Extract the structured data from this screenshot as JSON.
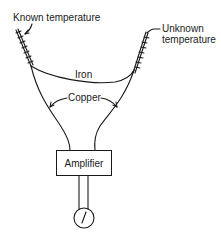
{
  "diagram": {
    "labels": {
      "known_temperature": "Known temperature",
      "unknown_temperature_line1": "Unknown",
      "unknown_temperature_line2": "temperature",
      "iron": "Iron",
      "copper": "Copper",
      "amplifier": "Amplifier"
    },
    "components": [
      {
        "id": "known-junction",
        "type": "twisted-wire-junction",
        "label": "Known temperature"
      },
      {
        "id": "unknown-junction",
        "type": "twisted-wire-junction",
        "label": "Unknown temperature"
      },
      {
        "id": "iron-wire",
        "type": "wire",
        "label": "Iron",
        "connects": [
          "known-junction",
          "unknown-junction"
        ]
      },
      {
        "id": "copper-wires",
        "type": "wire-pair",
        "label": "Copper",
        "connects": [
          "known-junction",
          "unknown-junction",
          "amplifier"
        ]
      },
      {
        "id": "amplifier",
        "type": "box",
        "label": "Amplifier"
      },
      {
        "id": "meter",
        "type": "gauge",
        "connects": [
          "amplifier"
        ]
      }
    ],
    "colors": {
      "stroke": "#1a1a1a",
      "background": "#ffffff"
    }
  }
}
